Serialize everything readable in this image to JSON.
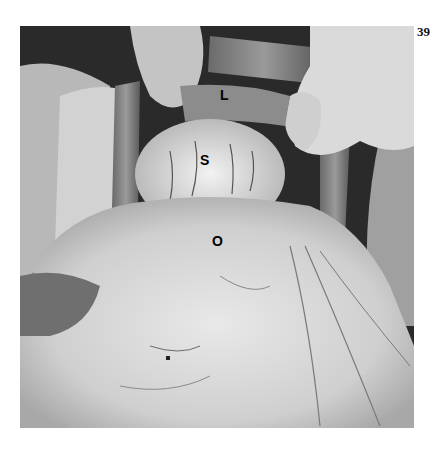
{
  "page": {
    "number": "39"
  },
  "figure": {
    "labels": [
      {
        "id": "L",
        "text": "L",
        "x": 224,
        "y": 96
      },
      {
        "id": "S",
        "text": "S",
        "x": 205,
        "y": 161
      },
      {
        "id": "O",
        "text": "O",
        "x": 218,
        "y": 242
      }
    ]
  }
}
